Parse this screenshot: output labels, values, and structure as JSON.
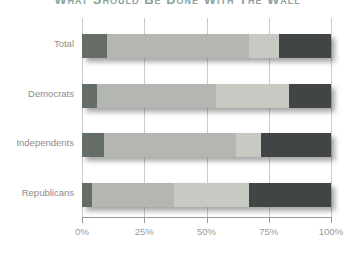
{
  "title": {
    "text": "What Should Be Done With The Wall",
    "visibility": "clipped-at-top-edge"
  },
  "chart_data": {
    "type": "bar",
    "variant": "horizontal-stacked",
    "title": "What Should Be Done With The Wall",
    "categories": [
      "Total",
      "Democrats",
      "Independents",
      "Republicans"
    ],
    "series": [
      {
        "name": "segment-1",
        "color": "#646e66",
        "values": [
          10,
          6,
          9,
          4
        ]
      },
      {
        "name": "segment-2",
        "color": "#b4b7b1",
        "values": [
          57,
          48,
          53,
          33
        ]
      },
      {
        "name": "segment-3",
        "color": "#c7c9c3",
        "values": [
          12,
          29,
          10,
          30
        ]
      },
      {
        "name": "segment-4",
        "color": "#414644",
        "values": [
          21,
          17,
          28,
          33
        ]
      }
    ],
    "x_axis": {
      "min": 0,
      "max": 100,
      "tick_labels": [
        "0%",
        "25%",
        "50%",
        "75%",
        "100%"
      ]
    },
    "grid": "vertical",
    "legend_visible": false,
    "styling": {
      "gridline_color": "#cbcbcb",
      "axis_color": "#9a9a9a",
      "label_color": "#8c8d8b",
      "background": "#ffffff",
      "bar_shadow": true
    }
  }
}
